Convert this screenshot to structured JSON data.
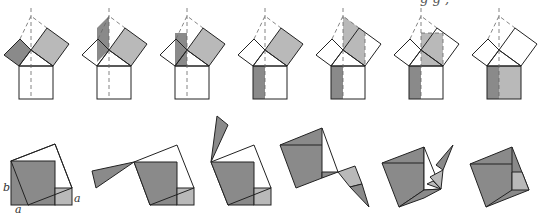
{
  "diagram": {
    "title": "",
    "colors": {
      "dark_fill": "#8a8a8a",
      "light_fill": "#b9b9b9",
      "stroke": "#222222",
      "dashed": "#666666",
      "background": "#ffffff"
    },
    "top_row": {
      "label": "Shearing proof sequence",
      "frames": 8,
      "frame_x": [
        31,
        107,
        183,
        260,
        335,
        412,
        488,
        535
      ]
    },
    "bottom_row": {
      "label": "Dissection rotation sequence",
      "frames": 6
    },
    "labels": {
      "b": "b",
      "a_right": "a",
      "a_bottom": "a"
    },
    "cut_off_caption_fragment": "g        g ,"
  }
}
